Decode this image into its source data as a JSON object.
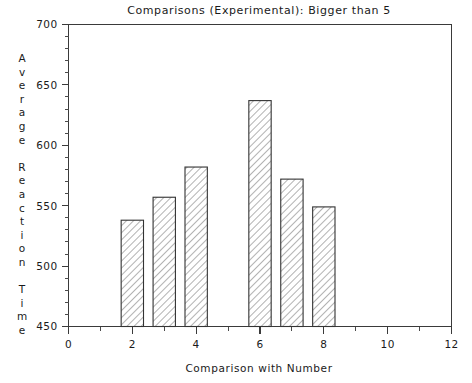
{
  "chart_data": {
    "type": "bar",
    "title": "Comparisons (Experimental): Bigger than 5",
    "xlabel": "Comparison with Number",
    "ylabel": "Average Reaction Time",
    "categories": [
      "2",
      "3",
      "4",
      "6",
      "7",
      "8"
    ],
    "x": [
      2,
      3,
      4,
      6,
      7,
      8
    ],
    "values": [
      538,
      557,
      582,
      637,
      572,
      549
    ],
    "xlim": [
      0,
      12
    ],
    "ylim": [
      450,
      700
    ],
    "x_ticks": [
      0,
      2,
      4,
      6,
      8,
      10,
      12
    ],
    "x_tick_labels": [
      "0",
      "2",
      "4",
      "6",
      "8",
      "10",
      "12"
    ],
    "x_minor_step": 1,
    "y_ticks": [
      450,
      500,
      550,
      600,
      650,
      700
    ],
    "y_tick_labels": [
      "450",
      "500",
      "550",
      "600",
      "650",
      "700"
    ],
    "y_minor_step": 10,
    "grid": false,
    "legend": null,
    "bar_width": 0.7,
    "bar_fill": "diagonal-hatch",
    "colors": {
      "axis": "#3a3a3a",
      "bar_outline": "#333333",
      "hatch": "#555555",
      "bar_face": "#ffffff",
      "background": "#ffffff",
      "text": "#1a1a1a"
    }
  },
  "axis_titles": {
    "y_chars": [
      "A",
      "v",
      "e",
      "r",
      "a",
      "g",
      "e",
      "",
      "R",
      "e",
      "a",
      "c",
      "t",
      "i",
      "o",
      "n",
      "",
      "T",
      "i",
      "m",
      "e"
    ]
  }
}
